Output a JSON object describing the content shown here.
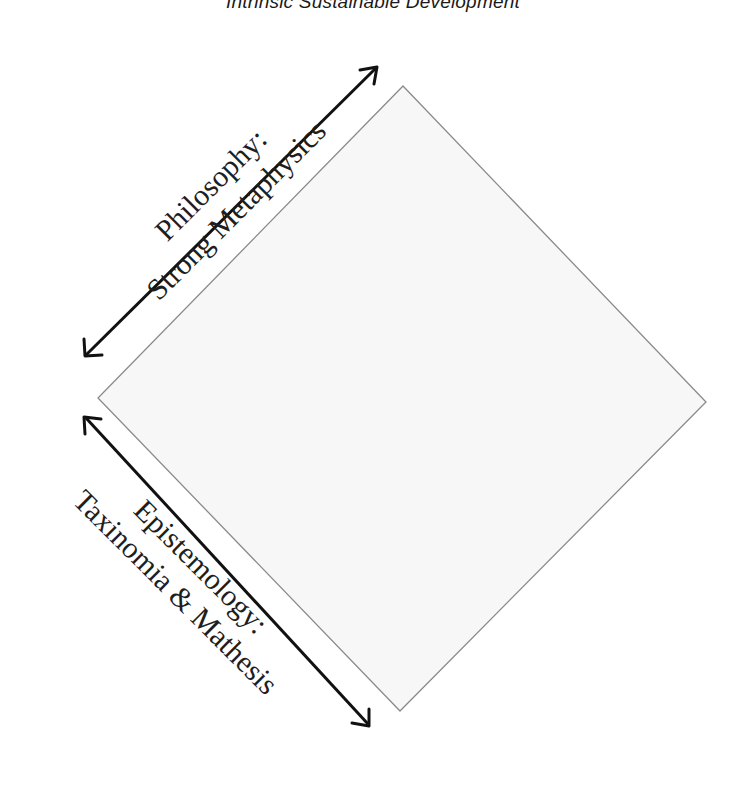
{
  "title": "Intrinsic Sustainable Development",
  "diagram": {
    "shape": "diamond",
    "colors": {
      "diamond_fill": "#f7f7f7",
      "diamond_stroke": "#8a8a8a",
      "arrow": "#111111",
      "text": "#1e1e1e"
    },
    "upper_axis": {
      "line1": "Philosophy:",
      "line2": "Strong Metaphysics",
      "arrow": "double-headed"
    },
    "lower_axis": {
      "line1": "Epistemology:",
      "line2": "Taxinomia & Mathesis",
      "arrow": "double-headed"
    }
  }
}
